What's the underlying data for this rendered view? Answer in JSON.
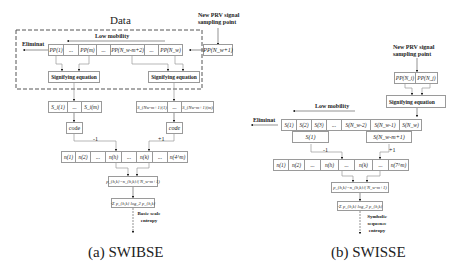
{
  "left": {
    "group_title": "Data",
    "new_point_label": "New PRV signal sampling point",
    "new_point_box": "PP(N_w+1)",
    "low_mobility": "Low mobility",
    "eliminat": "Eliminat",
    "pp_row": [
      "PP(1)",
      "...",
      "PP(m)",
      "...",
      "PP(N_w-m+2)",
      "...",
      "PP(N_w)"
    ],
    "signifying_1": "Signifying equation",
    "signifying_2": "Signifying equation",
    "s_row_left": [
      "S_i(1)",
      "...",
      "S_i(m)"
    ],
    "s_row_right": [
      "S_{Nw-m+1}(1)",
      "...",
      "S_{Nw-m+1}(m)"
    ],
    "code_left": "code",
    "code_right": "code",
    "minus_label": "-1",
    "plus_label": "+1",
    "n_row": [
      "n(1)",
      "n(2)",
      "...",
      "n(h)",
      "...",
      "n(k)",
      "...",
      "n(4^m)"
    ],
    "prob_eq": "p_{h,k}=n_{h,k}/( N_w-m+1)",
    "entropy_eq": "-Σ p_{h,k} log_2 p_{h,k}",
    "output_label": "Basic scale entropy",
    "caption": "(a) SWIBSE"
  },
  "right": {
    "new_point_label": "New PRV signal sampling point",
    "pp_pair": [
      "PP(N_i)",
      "PP(N_j)"
    ],
    "signifying": "Signifying equation",
    "low_mobility": "Low mobility",
    "eliminat": "Eliminat",
    "s_row": [
      "S(1)",
      "S(2)",
      "S(3)",
      "...",
      "S(N_w-2)",
      "S(N_w-1)",
      "S(N_w)"
    ],
    "s_group_left": "S(1)",
    "s_group_right": "S(N_w-m+1)",
    "minus_label": "-1",
    "plus_label": "+1",
    "n_row": [
      "n(1)",
      "n(2)",
      "...",
      "n(h)",
      "...",
      "n(k)",
      "...",
      "n(7^m)"
    ],
    "prob_eq": "p_{h,k}=n_{h,k}/( N_w-m+1)",
    "entropy_eq": "-Σ p_{h,k} log_2 p_{h,k}",
    "output_label": "Symbolic sequence entropy",
    "caption": "(b) SWISSE"
  }
}
